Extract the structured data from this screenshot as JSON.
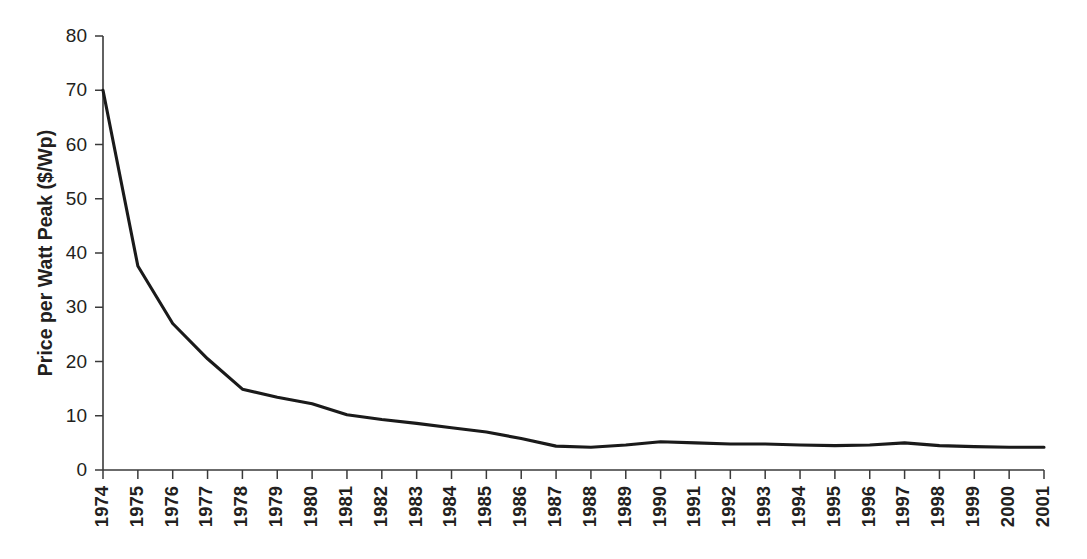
{
  "chart_data": {
    "type": "line",
    "title": "",
    "xlabel": "",
    "ylabel": "Price per Watt Peak ($/Wp)",
    "ylim": [
      0,
      80
    ],
    "yticks": [
      0,
      10,
      20,
      30,
      40,
      50,
      60,
      70,
      80
    ],
    "ytick_labels": [
      "0",
      "10",
      "20",
      "30",
      "40",
      "50",
      "60",
      "70",
      "80"
    ],
    "grid": false,
    "legend": null,
    "categories": [
      "1974",
      "1975",
      "1976",
      "1977",
      "1978",
      "1979",
      "1980",
      "1981",
      "1982",
      "1983",
      "1984",
      "1985",
      "1986",
      "1987",
      "1988",
      "1989",
      "1990",
      "1991",
      "1992",
      "1993",
      "1994",
      "1995",
      "1996",
      "1997",
      "1998",
      "1999",
      "2000",
      "2001"
    ],
    "series": [
      {
        "name": "Price per Watt Peak",
        "values": [
          70.0,
          37.6,
          27.0,
          20.5,
          14.9,
          13.4,
          12.2,
          10.2,
          9.3,
          8.6,
          7.8,
          7.0,
          5.8,
          4.4,
          4.2,
          4.6,
          5.2,
          5.0,
          4.8,
          4.8,
          4.6,
          4.5,
          4.6,
          5.0,
          4.5,
          4.3,
          4.2,
          4.2
        ]
      }
    ]
  }
}
